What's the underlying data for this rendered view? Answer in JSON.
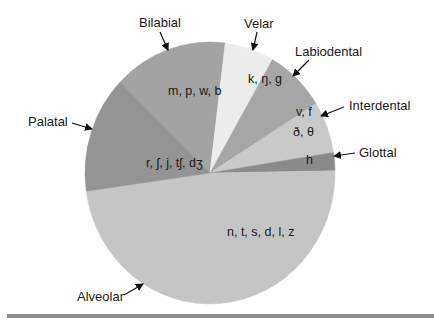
{
  "chart_data": {
    "type": "pie",
    "title": "",
    "legend": "none (callout labels with arrows)",
    "center": [
      210,
      173
    ],
    "radii": [
      125,
      131
    ],
    "slices": [
      {
        "name": "Bilabial",
        "phonemes": "m, p, w, b",
        "start_deg": 314,
        "end_deg": 367,
        "percent": 14.7,
        "color": "#a3a3a3",
        "label_pos": [
          186,
          70
        ],
        "arrow": [
          [
            160,
            32
          ],
          [
            168,
            51
          ]
        ],
        "phon_pos": [
          168,
          95
        ]
      },
      {
        "name": "Velar",
        "phonemes": "k, ŋ, g",
        "start_deg": 7,
        "end_deg": 30,
        "percent": 6.4,
        "color": "#ececec",
        "label_pos": [
          258,
          28
        ],
        "arrow": [
          [
            257,
            30
          ],
          [
            253,
            51
          ]
        ],
        "phon_pos": [
          248,
          83
        ]
      },
      {
        "name": "Labiodental",
        "phonemes": "v, f",
        "start_deg": 30,
        "end_deg": 58,
        "percent": 7.8,
        "color": "#a6a6a6",
        "label_pos": [
          312,
          54
        ],
        "arrow": [
          [
            308,
            60
          ],
          [
            292,
            77
          ]
        ],
        "phon_pos": [
          296,
          116
        ]
      },
      {
        "name": "Interdental",
        "phonemes": "ð, θ",
        "start_deg": 58,
        "end_deg": 81,
        "percent": 6.4,
        "color": "#c9c9c9",
        "label_pos": [
          348,
          108
        ],
        "arrow": [
          [
            344,
            107
          ],
          [
            320,
            117
          ]
        ],
        "phon_pos": [
          293,
          136
        ]
      },
      {
        "name": "Glottal",
        "phonemes": "h",
        "start_deg": 81,
        "end_deg": 89,
        "percent": 2.2,
        "color": "#8a8a8a",
        "label_pos": [
          359,
          156
        ],
        "arrow": [
          [
            355,
            153
          ],
          [
            333,
            156
          ]
        ],
        "phon_pos": [
          306,
          164
        ]
      },
      {
        "name": "Alveolar",
        "phonemes": "n, t, s, d, l, z",
        "start_deg": 89,
        "end_deg": 262,
        "percent": 48.0,
        "color": "#c5c5c5",
        "label_pos": [
          76,
          300
        ],
        "arrow": [
          [
            122,
            296
          ],
          [
            142,
            285
          ]
        ],
        "phon_pos": [
          227,
          236
        ]
      },
      {
        "name": "Palatal",
        "phonemes": "r, ʃ, j, tʃ, dʒ",
        "start_deg": 262,
        "end_deg": 314,
        "percent": 14.4,
        "color": "#949494",
        "label_pos": [
          30,
          126
        ],
        "arrow": [
          [
            73,
            122
          ],
          [
            92,
            129
          ]
        ],
        "phon_pos": [
          146,
          167
        ]
      }
    ]
  },
  "labels": {
    "bilabial": "Bilabial",
    "velar": "Velar",
    "labiodental": "Labiodental",
    "interdental": "Interdental",
    "glottal": "Glottal",
    "alveolar": "Alveolar",
    "palatal": "Palatal"
  },
  "phonemes": {
    "bilabial": "m, p, w, b",
    "velar": "k, ŋ, g",
    "labiodental": "v, f",
    "interdental": "ð, θ",
    "glottal": "h",
    "alveolar": "n, t, s, d, l, z",
    "palatal": "r, ʃ, j, tʃ, dʒ"
  }
}
